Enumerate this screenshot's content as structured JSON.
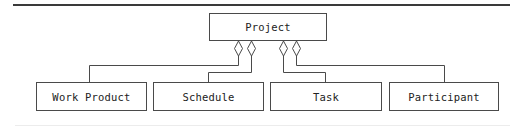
{
  "diagram": {
    "type": "uml-class-aggregation",
    "parent": {
      "label": "Project",
      "box": {
        "x": 209,
        "y": 13,
        "w": 118,
        "h": 28
      }
    },
    "children": [
      {
        "label": "Work Product",
        "box": {
          "x": 36,
          "y": 82,
          "w": 111,
          "h": 29
        }
      },
      {
        "label": "Schedule",
        "box": {
          "x": 153,
          "y": 82,
          "w": 111,
          "h": 29
        }
      },
      {
        "label": "Task",
        "box": {
          "x": 270,
          "y": 82,
          "w": 112,
          "h": 29
        }
      },
      {
        "label": "Participant",
        "box": {
          "x": 389,
          "y": 82,
          "w": 110,
          "h": 29
        }
      }
    ],
    "relationships": [
      {
        "from": "Project",
        "to": "Work Product",
        "kind": "aggregation",
        "marker": "hollow-diamond"
      },
      {
        "from": "Project",
        "to": "Schedule",
        "kind": "aggregation",
        "marker": "hollow-diamond"
      },
      {
        "from": "Project",
        "to": "Task",
        "kind": "aggregation",
        "marker": "hollow-diamond"
      },
      {
        "from": "Project",
        "to": "Participant",
        "kind": "aggregation",
        "marker": "hollow-diamond"
      }
    ],
    "colors": {
      "line": "#4a4a4a",
      "text": "#222222",
      "rule": "#3a3a3a",
      "background": "#ffffff"
    }
  }
}
